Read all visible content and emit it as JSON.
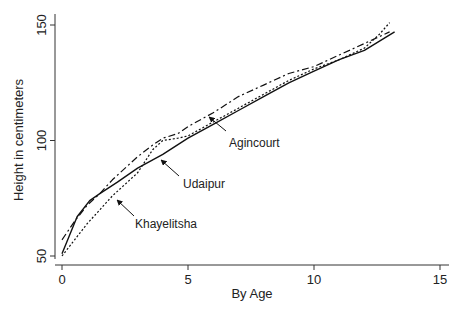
{
  "chart_data": {
    "type": "line",
    "title": "",
    "xlabel": "By Age",
    "ylabel": "Height in centimeters",
    "xlim": [
      -1,
      16
    ],
    "ylim": [
      48,
      155
    ],
    "x_ticks": [
      0,
      5,
      10,
      15
    ],
    "y_ticks": [
      50,
      100,
      150
    ],
    "x_tick_labels": [
      "0",
      "5",
      "10",
      "15"
    ],
    "y_tick_labels": [
      "50",
      "100",
      "150"
    ],
    "grid": false,
    "legend": "none (direct labels with arrows)",
    "series": [
      {
        "name": "Udaipur",
        "style": "solid",
        "color": "#111111",
        "x": [
          0,
          0.6,
          1.1,
          1.5,
          2.2,
          3.0,
          4.0,
          5.0,
          6.0,
          7.0,
          8.0,
          9.0,
          10.0,
          11.0,
          12.0,
          12.6,
          13.2
        ],
        "y": [
          51,
          67,
          74,
          77,
          82,
          88,
          94,
          101,
          107,
          113,
          119,
          125,
          130,
          135,
          139,
          143,
          147
        ]
      },
      {
        "name": "Agincourt",
        "style": "dash-dot",
        "color": "#111111",
        "x": [
          0,
          0.5,
          1.0,
          1.5,
          2.0,
          3.0,
          3.6,
          4.0,
          4.6,
          5.0,
          6.0,
          7.0,
          8.0,
          9.0,
          10.0,
          11.0,
          12.0,
          13.0
        ],
        "y": [
          57,
          65,
          72,
          77,
          83,
          93,
          98,
          101,
          103,
          106,
          112,
          119,
          124,
          129,
          132,
          137,
          142,
          147
        ]
      },
      {
        "name": "Khayelitsha",
        "style": "dotted",
        "color": "#111111",
        "x": [
          0,
          0.5,
          1.0,
          1.5,
          2.0,
          3.0,
          3.6,
          4.0,
          4.6,
          5.0,
          6.0,
          7.0,
          8.0,
          9.0,
          10.0,
          11.0,
          12.0,
          12.6,
          13.0
        ],
        "y": [
          50,
          57,
          64,
          70,
          76,
          86,
          96,
          100,
          101,
          102,
          108,
          114,
          120,
          126,
          131,
          135,
          140,
          146,
          151
        ]
      }
    ],
    "annotations": [
      {
        "text": "Agincourt",
        "points_to": "dash-dot line near age 5"
      },
      {
        "text": "Udaipur",
        "points_to": "solid line near age 4"
      },
      {
        "text": "Khayelitsha",
        "points_to": "dotted line near age 2"
      }
    ]
  },
  "labels": {
    "xlabel": "By Age",
    "ylabel": "Height in centimeters",
    "annot_agincourt": "Agincourt",
    "annot_udaipur": "Udaipur",
    "annot_khayelitsha": "Khayelitsha"
  }
}
